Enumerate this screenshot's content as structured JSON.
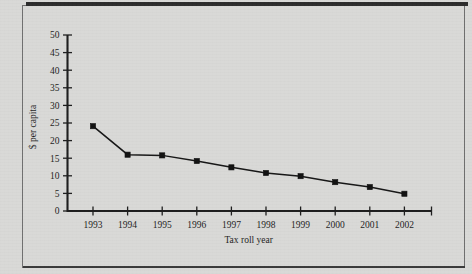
{
  "figure": {
    "background_color": "#d9d9d7",
    "ink_color": "#1d1d1d",
    "has_top_rule": true,
    "has_outer_frame": true
  },
  "chart_data": {
    "type": "line",
    "title": "",
    "subtitle": "",
    "xlabel": "Tax roll year",
    "ylabel": "$ per capita",
    "categories": [
      "1993",
      "1994",
      "1995",
      "1996",
      "1997",
      "1998",
      "1999",
      "2000",
      "2001",
      "2002"
    ],
    "values": [
      24.1,
      16.0,
      15.8,
      14.2,
      12.4,
      10.8,
      9.9,
      8.2,
      6.8,
      4.9
    ],
    "series": [
      {
        "name": "$ per capita",
        "values": [
          24.1,
          16.0,
          15.8,
          14.2,
          12.4,
          10.8,
          9.9,
          8.2,
          6.8,
          4.9
        ],
        "line_color": "#161616",
        "marker": "square",
        "marker_color": "#111111"
      }
    ],
    "ylim": [
      0,
      50
    ],
    "ytick_labels": [
      "0",
      "5",
      "10",
      "15",
      "20",
      "25",
      "30",
      "35",
      "40",
      "45",
      "50"
    ],
    "ytick_values": [
      0,
      5,
      10,
      15,
      20,
      25,
      30,
      35,
      40,
      45,
      50
    ],
    "xtick_labels": [
      "1993",
      "1994",
      "1995",
      "1996",
      "1997",
      "1998",
      "1999",
      "2000",
      "2001",
      "2002"
    ],
    "grid": false,
    "legend": null,
    "legend_position": "none",
    "annotations": []
  }
}
